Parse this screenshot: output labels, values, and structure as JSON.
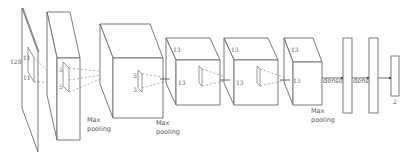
{
  "diagram": {
    "type": "cnn-architecture",
    "input": {
      "label": "128",
      "kernel_label_a": "11",
      "kernel_label_b": "11"
    },
    "layers": [
      {
        "id": "conv1",
        "kind": "conv",
        "kernel_label_a": "5",
        "kernel_label_b": "5",
        "caption": "Max pooling"
      },
      {
        "id": "conv2",
        "kind": "conv",
        "kernel_label_a": "3",
        "kernel_label_b": "3",
        "caption": "Max pooling"
      },
      {
        "id": "conv3",
        "kind": "conv",
        "side_label": "13",
        "front_label": "13",
        "kernel_label_a": "3",
        "kernel_label_b": "3",
        "caption": ""
      },
      {
        "id": "conv4",
        "kind": "conv",
        "side_label": "13",
        "front_label": "13",
        "kernel_label_a": "3",
        "kernel_label_b": "3",
        "caption": ""
      },
      {
        "id": "conv5",
        "kind": "conv",
        "side_label": "13",
        "front_label": "13",
        "caption": "Max pooling"
      }
    ],
    "dense": [
      {
        "id": "fc1",
        "label": "dense"
      },
      {
        "id": "fc2",
        "label": "dense"
      }
    ],
    "output": {
      "label": "2"
    }
  }
}
